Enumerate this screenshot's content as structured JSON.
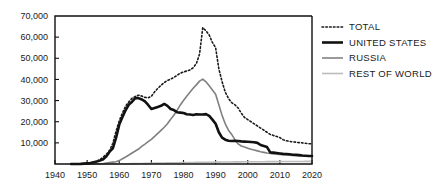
{
  "chart_data": {
    "type": "line",
    "title": "",
    "xlabel": "",
    "ylabel": "",
    "xlim": [
      1940,
      2020
    ],
    "ylim": [
      0,
      70000
    ],
    "grid": false,
    "legend_position": "right",
    "x_ticks": [
      1940,
      1950,
      1960,
      1970,
      1980,
      1990,
      2000,
      2010,
      2020
    ],
    "x_tick_labels": [
      "1940",
      "1950",
      "1960",
      "1970",
      "1980",
      "1990",
      "2000",
      "2010",
      "2020"
    ],
    "y_ticks": [
      10000,
      20000,
      30000,
      40000,
      50000,
      60000,
      70000
    ],
    "y_tick_labels": [
      "10,000",
      "20,000",
      "30,000",
      "40,000",
      "50,000",
      "60,000",
      "70,000"
    ],
    "x": [
      1945,
      1946,
      1947,
      1948,
      1949,
      1950,
      1951,
      1952,
      1953,
      1954,
      1955,
      1956,
      1957,
      1958,
      1959,
      1960,
      1961,
      1962,
      1963,
      1964,
      1965,
      1966,
      1967,
      1968,
      1969,
      1970,
      1971,
      1972,
      1973,
      1974,
      1975,
      1976,
      1977,
      1978,
      1979,
      1980,
      1981,
      1982,
      1983,
      1984,
      1985,
      1986,
      1987,
      1988,
      1989,
      1990,
      1991,
      1992,
      1993,
      1994,
      1995,
      1996,
      1997,
      1998,
      1999,
      2000,
      2001,
      2002,
      2003,
      2004,
      2005,
      2006,
      2007,
      2008,
      2009,
      2010,
      2011,
      2012,
      2013,
      2014,
      2015,
      2016,
      2017,
      2018,
      2019,
      2020
    ],
    "series": [
      {
        "name": "TOTAL",
        "style": "dotted",
        "color": "#1a1a1a",
        "width": 1.6,
        "values": [
          2,
          9,
          13,
          50,
          170,
          304,
          438,
          842,
          1327,
          2063,
          3279,
          4618,
          6444,
          9822,
          15468,
          20434,
          24126,
          27387,
          29459,
          31139,
          31937,
          32552,
          32138,
          31510,
          31283,
          32025,
          34100,
          35750,
          37200,
          38500,
          39500,
          40150,
          40950,
          41950,
          42950,
          43500,
          44000,
          44500,
          45500,
          47500,
          52000,
          64500,
          63000,
          61000,
          57500,
          55000,
          45000,
          39000,
          34000,
          31000,
          29000,
          28000,
          26500,
          24000,
          22000,
          21000,
          20000,
          19000,
          18000,
          17000,
          16000,
          15000,
          14000,
          13500,
          13000,
          12500,
          11500,
          11000,
          10700,
          10500,
          10300,
          10100,
          10000,
          9800,
          9600,
          9500
        ]
      },
      {
        "name": "UNITED STATES",
        "style": "solid",
        "color": "#111111",
        "width": 2.6,
        "values": [
          2,
          9,
          13,
          50,
          170,
          299,
          438,
          832,
          1161,
          1630,
          2280,
          3620,
          5828,
          7402,
          12305,
          18638,
          22229,
          25540,
          28133,
          29463,
          31139,
          31175,
          30520,
          29592,
          27936,
          26008,
          26500,
          27000,
          27500,
          28400,
          27500,
          26000,
          25500,
          24500,
          24300,
          24100,
          23500,
          23400,
          23200,
          23500,
          23400,
          23400,
          23600,
          22800,
          21000,
          19000,
          15000,
          12500,
          11500,
          11000,
          10900,
          11000,
          10900,
          10700,
          10600,
          10500,
          10400,
          10300,
          10000,
          9000,
          8500,
          8000,
          5500,
          5400,
          5200,
          5000,
          4800,
          4700,
          4600,
          4400,
          4300,
          4200,
          4000,
          3900,
          3800,
          3800
        ]
      },
      {
        "name": "RUSSIA",
        "style": "solid",
        "color": "#808080",
        "width": 1.6,
        "values": [
          0,
          0,
          0,
          0,
          1,
          5,
          25,
          50,
          120,
          150,
          200,
          426,
          660,
          869,
          1060,
          1605,
          2471,
          3322,
          4238,
          5221,
          6129,
          7089,
          8339,
          9399,
          10538,
          11643,
          13092,
          14478,
          15915,
          17385,
          19055,
          21205,
          23044,
          25393,
          27935,
          30062,
          32049,
          33952,
          35804,
          37431,
          39197,
          40159,
          38859,
          37000,
          35000,
          33000,
          28000,
          23000,
          19000,
          16000,
          14000,
          11500,
          9500,
          8500,
          8000,
          7500,
          7000,
          6600,
          6200,
          5800,
          5500,
          5200,
          5000,
          4800,
          4600,
          4500,
          4400,
          4300,
          4200,
          4100,
          4000,
          3900,
          3800,
          3800,
          3800,
          3800
        ]
      },
      {
        "name": "REST OF WORLD",
        "style": "solid",
        "color": "#bcbcbc",
        "width": 1.6,
        "values": [
          0,
          0,
          0,
          0,
          0,
          0,
          0,
          0,
          6,
          10,
          14,
          21,
          28,
          37,
          48,
          65,
          85,
          110,
          135,
          160,
          185,
          215,
          250,
          290,
          330,
          370,
          400,
          430,
          460,
          490,
          520,
          550,
          580,
          610,
          640,
          670,
          700,
          720,
          740,
          760,
          780,
          800,
          820,
          840,
          860,
          880,
          900,
          920,
          940,
          960,
          980,
          1000,
          1010,
          1020,
          1030,
          1040,
          1050,
          1060,
          1070,
          1080,
          1090,
          1100,
          1110,
          1120,
          1130,
          1140,
          1150,
          1160,
          1170,
          1180,
          1190,
          1200,
          1210,
          1220,
          1230,
          1240
        ]
      }
    ]
  },
  "legend": {
    "items": [
      {
        "label": "TOTAL",
        "swatch": "dotted-line-swatch"
      },
      {
        "label": "UNITED STATES",
        "swatch": "thick-line-swatch"
      },
      {
        "label": "RUSSIA",
        "swatch": "medium-line-swatch"
      },
      {
        "label": "REST OF WORLD",
        "swatch": "light-line-swatch"
      }
    ]
  },
  "colors": {
    "total": "#1a1a1a",
    "united_states": "#111111",
    "russia": "#808080",
    "rest_of_world": "#bcbcbc",
    "axis": "#111111",
    "background": "#ffffff"
  }
}
